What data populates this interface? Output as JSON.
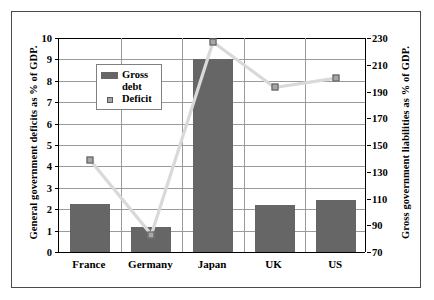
{
  "chart_data": {
    "type": "bar",
    "title": "",
    "categories": [
      "France",
      "Germany",
      "Japan",
      "UK",
      "US"
    ],
    "series": [
      {
        "name": "Gross debt",
        "type": "bar",
        "axis": "left",
        "values": [
          2.25,
          1.15,
          9.0,
          2.2,
          2.45
        ]
      },
      {
        "name": "Deficit",
        "type": "line",
        "axis": "right",
        "values": [
          139,
          83,
          227,
          193,
          200
        ],
        "left_axis_equivalent": [
          4.45,
          0.9,
          9.85,
          7.7,
          8.3
        ]
      }
    ],
    "xlabel": "",
    "ylabel": "General government deficits as % of GDP.",
    "y2label": "Gross government liabilities as % of GDP.",
    "ylim": [
      0,
      10
    ],
    "y2lim": [
      70,
      230
    ],
    "yticks": [
      0,
      1,
      2,
      3,
      4,
      5,
      6,
      7,
      8,
      9,
      10
    ],
    "y2ticks": [
      70,
      90,
      110,
      130,
      150,
      170,
      190,
      210,
      230
    ],
    "ytick_labels": [
      "0",
      "1",
      "2",
      "3",
      "4",
      "5",
      "6",
      "7",
      "8",
      "9",
      "10"
    ],
    "y2tick_labels": [
      "70",
      "90",
      "110",
      "130",
      "150",
      "170",
      "190",
      "210",
      "230"
    ],
    "grid": true,
    "legend_position": "upper-left-inside",
    "legend_entries": [
      "Gross\ndebt",
      "Deficit"
    ],
    "colors": {
      "bar": "#666666",
      "line": "#d9d9d9",
      "marker_fill": "#a6a6a6",
      "marker_edge": "#595959",
      "grid": "#9a9a9a",
      "axis": "#000000",
      "frame": "#4a4a4a",
      "background": "#ffffff"
    }
  }
}
